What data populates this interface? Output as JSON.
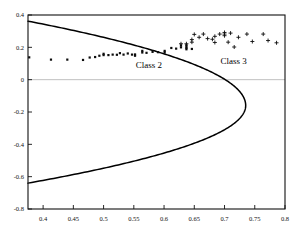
{
  "chart_data": {
    "type": "scatter",
    "title": "",
    "xlabel": "",
    "ylabel": "",
    "xlim": [
      0.375,
      0.8
    ],
    "ylim": [
      -0.8,
      0.4
    ],
    "grid": false,
    "legend_position": "in-plot-annotations",
    "xticks": [
      0.4,
      0.45,
      0.5,
      0.55,
      0.6,
      0.65,
      0.7,
      0.75,
      0.8
    ],
    "xtick_labels": [
      "0.4",
      "0.45",
      "0.5",
      "0.55",
      "0.6",
      "0.65",
      "0.7",
      "0.75",
      "0.8"
    ],
    "yticks": [
      0.4,
      0.2,
      0,
      -0.2,
      -0.4,
      -0.6,
      -0.8
    ],
    "ytick_labels": [
      "0.4",
      "0.2",
      "0",
      "-0.2",
      "-0.4",
      "-0.6",
      "-0.8"
    ],
    "zero_line": 0,
    "annotations": [
      {
        "text": "Class 2",
        "x": 0.575,
        "y": 0.072
      },
      {
        "text": "Class 3",
        "x": 0.715,
        "y": 0.095
      }
    ],
    "series": [
      {
        "name": "Class 2",
        "marker": "dot",
        "color": "#0d0d0d",
        "points": [
          [
            0.377,
            0.138
          ],
          [
            0.413,
            0.124
          ],
          [
            0.44,
            0.124
          ],
          [
            0.466,
            0.122
          ],
          [
            0.477,
            0.137
          ],
          [
            0.486,
            0.14
          ],
          [
            0.493,
            0.148
          ],
          [
            0.5,
            0.152
          ],
          [
            0.5,
            0.16
          ],
          [
            0.508,
            0.152
          ],
          [
            0.515,
            0.155
          ],
          [
            0.522,
            0.154
          ],
          [
            0.527,
            0.164
          ],
          [
            0.533,
            0.155
          ],
          [
            0.54,
            0.162
          ],
          [
            0.547,
            0.155
          ],
          [
            0.552,
            0.156
          ],
          [
            0.552,
            0.148
          ],
          [
            0.564,
            0.178
          ],
          [
            0.564,
            0.168
          ],
          [
            0.571,
            0.166
          ],
          [
            0.581,
            0.172
          ],
          [
            0.59,
            0.17
          ],
          [
            0.601,
            0.168
          ],
          [
            0.601,
            0.178
          ],
          [
            0.612,
            0.196
          ],
          [
            0.62,
            0.192
          ],
          [
            0.628,
            0.2
          ],
          [
            0.628,
            0.212
          ],
          [
            0.637,
            0.188
          ],
          [
            0.637,
            0.196
          ],
          [
            0.637,
            0.205
          ],
          [
            0.637,
            0.214
          ],
          [
            0.646,
            0.19
          ]
        ]
      },
      {
        "name": "Class 3",
        "marker": "plus",
        "color": "#0d0d0d",
        "points": [
          [
            0.628,
            0.222
          ],
          [
            0.637,
            0.222
          ],
          [
            0.646,
            0.232
          ],
          [
            0.646,
            0.248
          ],
          [
            0.65,
            0.28
          ],
          [
            0.658,
            0.262
          ],
          [
            0.665,
            0.282
          ],
          [
            0.672,
            0.254
          ],
          [
            0.68,
            0.25
          ],
          [
            0.684,
            0.268
          ],
          [
            0.684,
            0.23
          ],
          [
            0.692,
            0.282
          ],
          [
            0.7,
            0.272
          ],
          [
            0.7,
            0.282
          ],
          [
            0.7,
            0.292
          ],
          [
            0.706,
            0.232
          ],
          [
            0.71,
            0.288
          ],
          [
            0.716,
            0.202
          ],
          [
            0.723,
            0.262
          ],
          [
            0.737,
            0.282
          ],
          [
            0.746,
            0.236
          ],
          [
            0.764,
            0.282
          ],
          [
            0.772,
            0.242
          ],
          [
            0.786,
            0.228
          ]
        ]
      }
    ],
    "boundary_curve": {
      "name": "decision boundary",
      "shape": "leftward-opening parabola",
      "vertex": [
        0.735,
        -0.16
      ],
      "upper_endpoint": [
        0.375,
        0.362
      ],
      "lower_endpoint": [
        0.375,
        -0.64
      ],
      "color": "#000000"
    }
  }
}
